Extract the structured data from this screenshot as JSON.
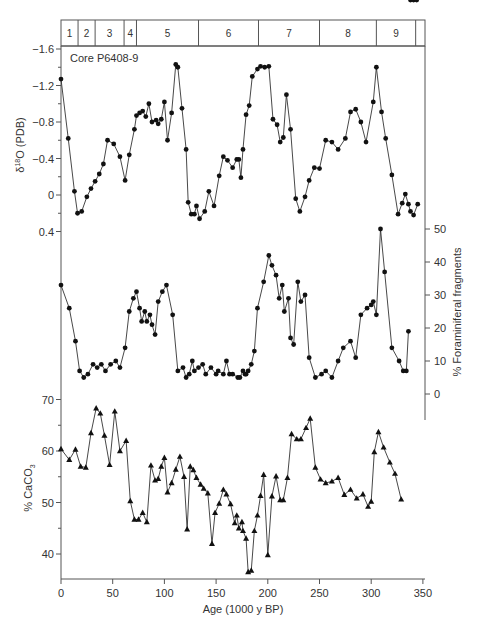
{
  "chart_data": [
    {
      "type": "line",
      "title": "Core P6408-9",
      "panel": "top",
      "xlabel": "Age (1000 y BP)",
      "ylabel": "δ 18O (PDB)",
      "y_axis_reversed": true,
      "ylim": [
        -1.6,
        0.4
      ],
      "yticks": [
        "-1.6",
        "-1.2",
        "-0.8",
        "-0.4",
        "0",
        "0.4"
      ],
      "marker": "circle",
      "x": [
        0,
        7,
        13,
        16,
        20,
        25,
        29,
        33,
        37,
        41,
        45,
        51,
        57,
        62,
        66,
        71,
        73,
        76,
        79,
        82,
        85,
        88,
        92,
        94,
        97,
        100,
        103,
        107,
        111,
        113,
        117,
        121,
        123,
        126,
        129,
        131,
        134,
        139,
        143,
        148,
        153,
        157,
        161,
        166,
        170,
        172,
        174,
        176,
        179,
        182,
        185,
        190,
        193,
        197,
        201,
        205,
        209,
        212,
        215,
        218,
        222,
        227,
        231,
        236,
        240,
        245,
        250,
        256,
        262,
        268,
        275,
        280,
        285,
        290,
        295,
        302,
        305,
        310,
        314,
        320,
        326,
        330,
        333,
        336,
        338,
        341,
        345
      ],
      "values": [
        -1.27,
        -0.62,
        -0.04,
        0.2,
        0.18,
        0.02,
        -0.07,
        -0.15,
        -0.23,
        -0.34,
        -0.6,
        -0.56,
        -0.42,
        -0.16,
        -0.44,
        -0.72,
        -0.87,
        -0.9,
        -0.92,
        -0.86,
        -1.0,
        -0.8,
        -0.82,
        -0.78,
        -0.83,
        -1.02,
        -0.6,
        -0.9,
        -1.43,
        -1.4,
        -0.95,
        -0.5,
        0.08,
        0.21,
        0.21,
        0.12,
        0.26,
        0.18,
        -0.04,
        0.12,
        -0.21,
        -0.42,
        -0.38,
        -0.3,
        -0.39,
        -0.39,
        -0.19,
        -0.5,
        -0.88,
        -0.98,
        -1.3,
        -1.38,
        -1.41,
        -1.4,
        -1.41,
        -0.83,
        -0.77,
        -0.58,
        -0.63,
        -1.1,
        -0.72,
        0.04,
        0.18,
        0.02,
        -0.16,
        -0.3,
        -0.29,
        -0.6,
        -0.58,
        -0.5,
        -0.62,
        -0.91,
        -0.94,
        -0.8,
        -0.58,
        -1.02,
        -1.4,
        -0.91,
        -0.62,
        -0.22,
        0.21,
        0.09,
        -0.01,
        0.1,
        0.18,
        0.22,
        0.1
      ]
    },
    {
      "type": "line",
      "panel": "middle",
      "ylabel": "% Foraminiferal fragments",
      "ylim": [
        -5,
        55
      ],
      "yticks": [
        "0",
        "10",
        "20",
        "30",
        "40",
        "50"
      ],
      "marker": "circle",
      "x": [
        0,
        8,
        14,
        18,
        22,
        26,
        31,
        35,
        39,
        43,
        48,
        53,
        57,
        62,
        66,
        70,
        73,
        76,
        78,
        81,
        83,
        86,
        88,
        91,
        94,
        98,
        102,
        108,
        113,
        118,
        121,
        124,
        127,
        129,
        133,
        137,
        140,
        145,
        150,
        152,
        157,
        160,
        163,
        166,
        171,
        173,
        176,
        178,
        179,
        181,
        184,
        187,
        190,
        196,
        201,
        204,
        208,
        211,
        214,
        216,
        220,
        222,
        225,
        229,
        232,
        236,
        240,
        246,
        252,
        256,
        262,
        268,
        273,
        280,
        285,
        290,
        296,
        300,
        302,
        305,
        309,
        313,
        320,
        327,
        331,
        334,
        336,
        338,
        341,
        344
      ],
      "values": [
        33,
        26,
        16,
        7,
        5,
        6,
        9,
        8,
        9,
        7,
        9,
        10,
        8,
        14,
        25,
        29,
        31,
        26,
        22,
        25,
        22,
        24,
        21,
        18,
        28,
        31,
        33,
        24,
        7,
        8,
        5,
        6,
        10,
        7,
        8,
        9,
        6,
        8,
        6,
        7,
        6,
        10,
        6,
        6,
        5,
        5,
        7,
        6,
        6,
        7,
        9,
        13,
        26,
        34,
        42,
        39,
        36,
        29,
        33,
        25,
        29,
        17,
        15,
        34,
        28,
        30,
        11,
        5,
        6,
        7,
        5,
        10,
        14,
        16,
        11,
        24,
        26,
        27,
        28,
        24,
        50,
        37,
        14,
        10,
        7,
        7,
        19
      ],
      "y_axis_side": "right"
    },
    {
      "type": "line",
      "panel": "bottom",
      "ylabel": "% CaCO3",
      "ylim": [
        36,
        71
      ],
      "yticks": [
        "40",
        "50",
        "60",
        "70"
      ],
      "xticks": [
        "0",
        "50",
        "100",
        "150",
        "200",
        "250",
        "300",
        "350"
      ],
      "xlim": [
        0,
        350
      ],
      "marker": "triangle",
      "x": [
        0,
        8,
        14,
        19,
        24,
        29,
        34,
        38,
        42,
        47,
        52,
        57,
        63,
        67,
        71,
        75,
        79,
        83,
        87,
        91,
        94,
        97,
        100,
        103,
        107,
        111,
        115,
        119,
        122,
        125,
        128,
        131,
        135,
        138,
        142,
        146,
        149,
        153,
        157,
        160,
        164,
        168,
        170,
        172,
        175,
        176,
        179,
        181,
        184,
        187,
        190,
        193,
        196,
        200,
        204,
        208,
        212,
        215,
        219,
        223,
        228,
        232,
        237,
        241,
        246,
        251,
        256,
        262,
        268,
        274,
        280,
        286,
        292,
        297,
        300,
        303,
        307,
        312,
        318,
        323,
        329,
        332,
        334,
        336,
        339,
        342,
        345
      ],
      "values": [
        60.4,
        58.3,
        60.3,
        57,
        56.8,
        63.5,
        68.3,
        67.3,
        63,
        57.3,
        67.7,
        60,
        62,
        50.3,
        46.7,
        46.7,
        48,
        46.2,
        57.2,
        54.3,
        54.6,
        57,
        58.7,
        52,
        53.8,
        56.4,
        58.9,
        55,
        44.8,
        57,
        56.3,
        54.8,
        53.5,
        52.7,
        51.8,
        42,
        48,
        49.8,
        52.5,
        51.6,
        49.7,
        46,
        47.5,
        45,
        46.2,
        44.5,
        43,
        36.5,
        36.8,
        44.5,
        47.5,
        51.3,
        55.4,
        39.8,
        51.2,
        55.1,
        50.5,
        50.5,
        54.8,
        63.3,
        62.3,
        62.3,
        64.5,
        66.3,
        56.8,
        54.5,
        53.8,
        54.1,
        54.8,
        51.5,
        52.5,
        50.8,
        51.6,
        49.2,
        50.2,
        59.8,
        63.7,
        60.7,
        57.8,
        55.6,
        50.6
      ],
      "grid": false
    }
  ],
  "figure": {
    "core_label": "Core P6408-9",
    "x_axis_title": "Age (1000 y BP)",
    "x_ticks": [
      "0",
      "50",
      "100",
      "150",
      "200",
      "250",
      "300",
      "350"
    ],
    "left_top_axis_title": "δ",
    "left_top_axis_title_sup": "18",
    "left_top_axis_title_rest": "O (PDB)",
    "left_top_ticks": [
      "-1.6",
      "-1.2",
      "-0.8",
      "-0.4",
      "0",
      "0.4"
    ],
    "right_mid_axis_title": "% Foraminiferal fragments",
    "right_mid_ticks": [
      "50",
      "40",
      "30",
      "20",
      "10",
      "0"
    ],
    "left_bottom_axis_title": "% CaCO",
    "left_bottom_axis_title_sub": "3",
    "left_bottom_ticks": [
      "70",
      "60",
      "50",
      "40"
    ],
    "stages": [
      {
        "label": "1",
        "start": 0,
        "end": 16.5
      },
      {
        "label": "2",
        "start": 16.5,
        "end": 33
      },
      {
        "label": "3",
        "start": 33,
        "end": 61
      },
      {
        "label": "4",
        "start": 61,
        "end": 73
      },
      {
        "label": "5",
        "start": 73,
        "end": 133
      },
      {
        "label": "6",
        "start": 133,
        "end": 191
      },
      {
        "label": "7",
        "start": 191,
        "end": 250
      },
      {
        "label": "8",
        "start": 250,
        "end": 305
      },
      {
        "label": "9",
        "start": 305,
        "end": 343
      },
      {
        "label": "",
        "start": 343,
        "end": 352
      }
    ],
    "colors": {
      "line": "#333333",
      "marker": "#111111",
      "axis": "#555555",
      "text": "#333333"
    }
  }
}
